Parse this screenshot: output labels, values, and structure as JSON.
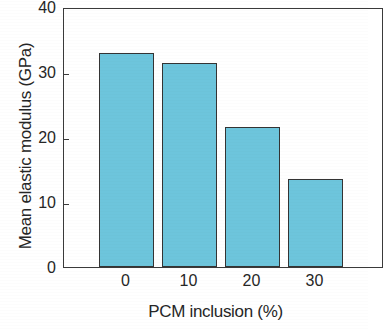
{
  "chart_data": {
    "type": "bar",
    "title": "",
    "subtitle": "",
    "xlabel": "PCM inclusion (%)",
    "ylabel": "Mean elastic modulus (GPa)",
    "categories": [
      "0",
      "10",
      "20",
      "30"
    ],
    "values": [
      33.0,
      31.4,
      21.5,
      13.5
    ],
    "ylim": [
      0,
      40
    ],
    "yticks": [
      "0",
      "10",
      "20",
      "30",
      "40"
    ],
    "ytick_values": [
      0,
      10,
      20,
      30,
      40
    ],
    "xticks": [
      "0",
      "10",
      "20",
      "30"
    ],
    "grid": false,
    "legend": false,
    "legend_position": "none",
    "bar_color": "#6dc5dc",
    "bar_edge_color": "#343434",
    "axis_color": "#3a3a3a",
    "background_color": "#ffffff",
    "series": [
      {
        "name": "Mean elastic modulus",
        "values": [
          33.0,
          31.4,
          21.5,
          13.5
        ]
      }
    ]
  }
}
